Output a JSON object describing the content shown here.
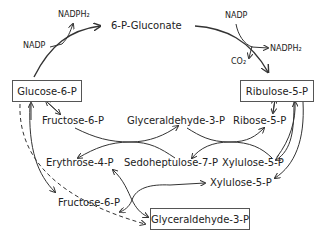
{
  "diagram": {
    "boxes": {
      "glucose6p": "Glucose-6-P",
      "ribulose5p": "Ribulose-5-P",
      "glyceraldehyde3p_bottom": "Glyceraldehyde-3-P"
    },
    "labels": {
      "gluconate": "6-P-Gluconate",
      "nadp_left": "NADP",
      "nadph2_left": "NADPH₂",
      "nadp_right": "NADP",
      "nadph2_right": "NADPH₂",
      "co2": "CO₂",
      "fructose6p_top": "Fructose-6-P",
      "glyceraldehyde3p_mid": "Glyceraldehyde-3-P",
      "ribose5p": "Ribose-5-P",
      "erythrose4p": "Erythrose-4-P",
      "sedoheptulose7p": "Sedoheptulose-7-P",
      "xylulose5p_mid": "Xylulose-5-P",
      "xylulose5p_low": "Xylulose-5-P",
      "fructose6p_bottom": "Fructose-6-P"
    },
    "colors": {
      "line": "#333333",
      "box_border": "#555555"
    }
  }
}
